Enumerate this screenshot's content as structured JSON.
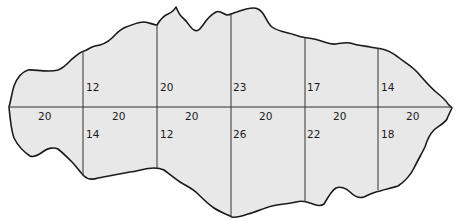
{
  "diagram": {
    "type": "offset-survey",
    "colors": {
      "fill": "#e8e8e8",
      "outline": "#1a1a1a",
      "lines": "#333333",
      "text": "#1a1a1a"
    },
    "baseline": {
      "segments": [
        {
          "label": "20"
        },
        {
          "label": "20"
        },
        {
          "label": "20"
        },
        {
          "label": "20"
        },
        {
          "label": "20"
        },
        {
          "label": "20"
        }
      ]
    },
    "offsets_above": [
      {
        "label": "12"
      },
      {
        "label": "20"
      },
      {
        "label": "23"
      },
      {
        "label": "17"
      },
      {
        "label": "14"
      }
    ],
    "offsets_below": [
      {
        "label": "14"
      },
      {
        "label": "12"
      },
      {
        "label": "26"
      },
      {
        "label": "22"
      },
      {
        "label": "18"
      }
    ]
  }
}
